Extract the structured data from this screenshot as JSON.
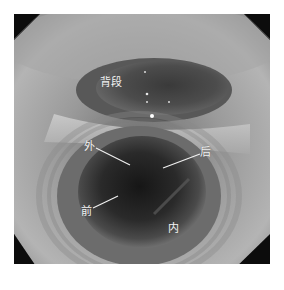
{
  "figure": {
    "labels": {
      "superior_segment": "背段",
      "lateral": "外",
      "posterior": "后",
      "anterior": "前",
      "medial": "内"
    },
    "colors": {
      "mucosa_light": "#b8b8b8",
      "mucosa_mid": "#8a8a8a",
      "lumen_dark": "#1c1c1c",
      "frame_black": "#0c0c0c",
      "label_text": "#f2f2f2"
    }
  }
}
